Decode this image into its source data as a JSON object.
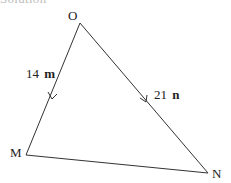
{
  "heading": "Solution",
  "diagram": {
    "type": "triangle",
    "vertices": [
      {
        "name": "O",
        "x": 80,
        "y": 23,
        "label_x": 68,
        "label_y": 20
      },
      {
        "name": "M",
        "x": 26,
        "y": 155,
        "label_x": 10,
        "label_y": 157
      },
      {
        "name": "N",
        "x": 208,
        "y": 173,
        "label_x": 212,
        "label_y": 178
      }
    ],
    "edges": [
      {
        "from": "O",
        "to": "M",
        "label_coef": "14",
        "label_vec": "m",
        "arrow": "toward M"
      },
      {
        "from": "O",
        "to": "N",
        "label_coef": "21",
        "label_vec": "n",
        "arrow": "toward N"
      },
      {
        "from": "M",
        "to": "N",
        "label_coef": "",
        "label_vec": "",
        "arrow": "none"
      }
    ],
    "line_color": "#333333"
  }
}
